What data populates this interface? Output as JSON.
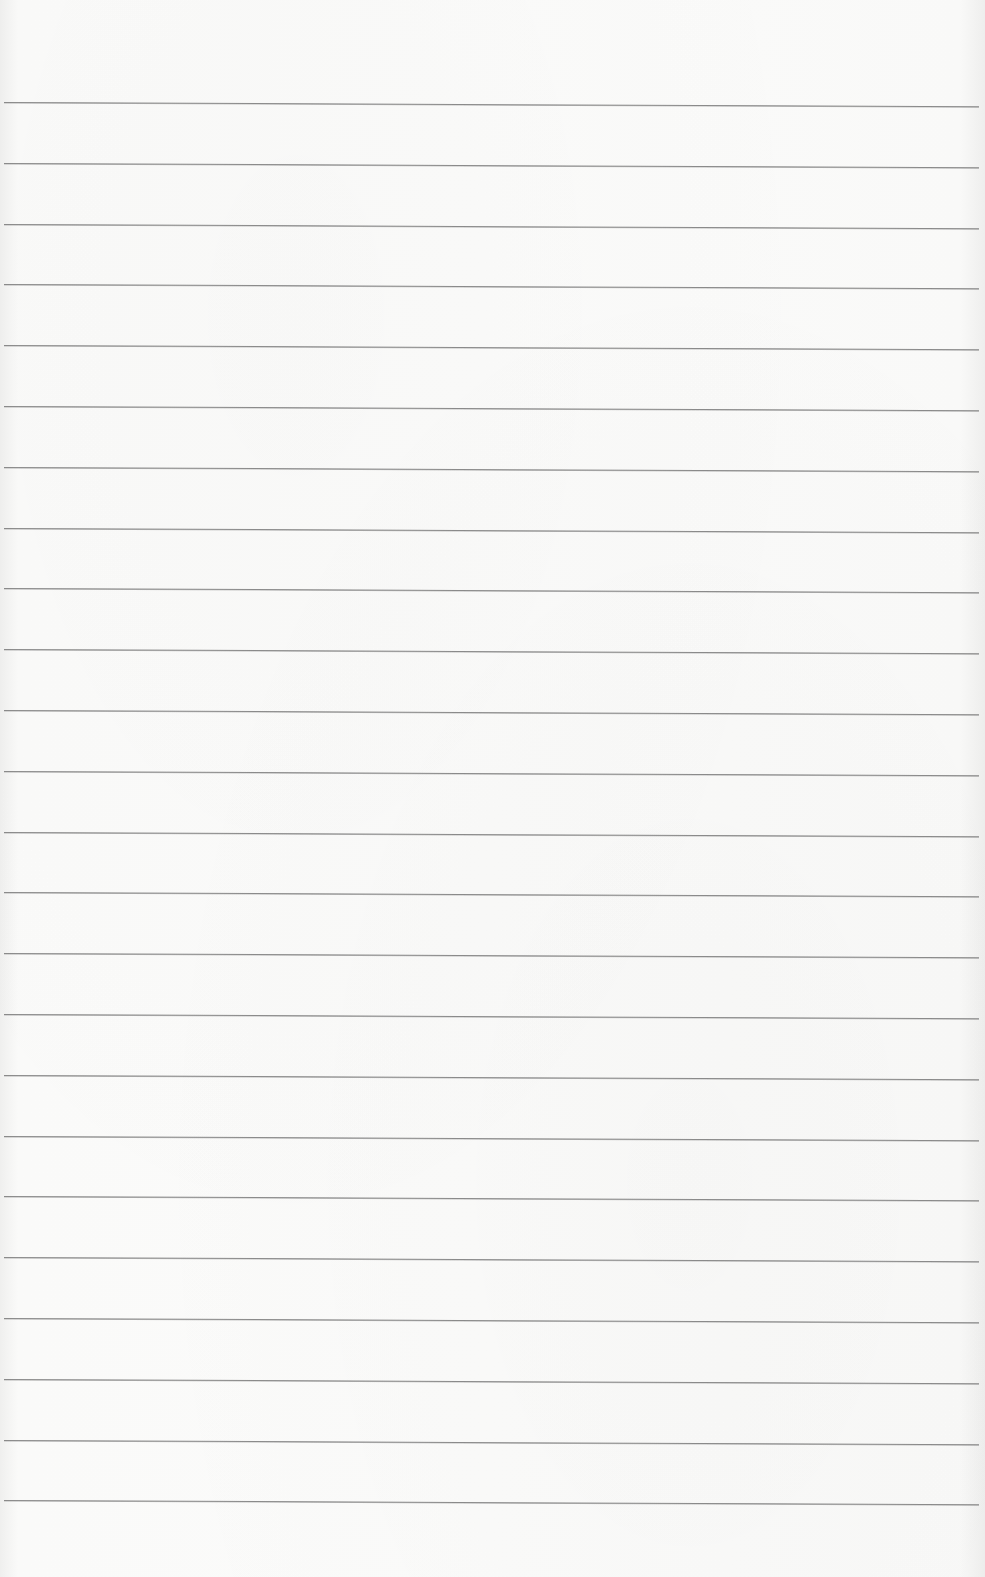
{
  "document": {
    "type": "lined-paper",
    "text_content": "",
    "rules": {
      "count": 24,
      "first_y": 102,
      "spacing": 60.8,
      "color": "#8a8a8a"
    },
    "paper_color": "#fafaf9"
  }
}
